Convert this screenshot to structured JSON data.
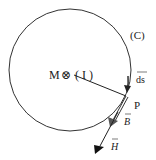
{
  "diagram": {
    "labels": {
      "center_point": "M",
      "current_symbol": "⊗",
      "current_name": "( I )",
      "curve_name": "(C)",
      "element_vector": "ds",
      "point": "P",
      "field_B": "B",
      "field_H": "H"
    },
    "colors": {
      "stroke": "#222222",
      "background": "#ffffff"
    },
    "geometry": {
      "circle_center": [
        70,
        70
      ],
      "circle_radius": 61,
      "point_P": [
        126,
        96
      ]
    }
  }
}
